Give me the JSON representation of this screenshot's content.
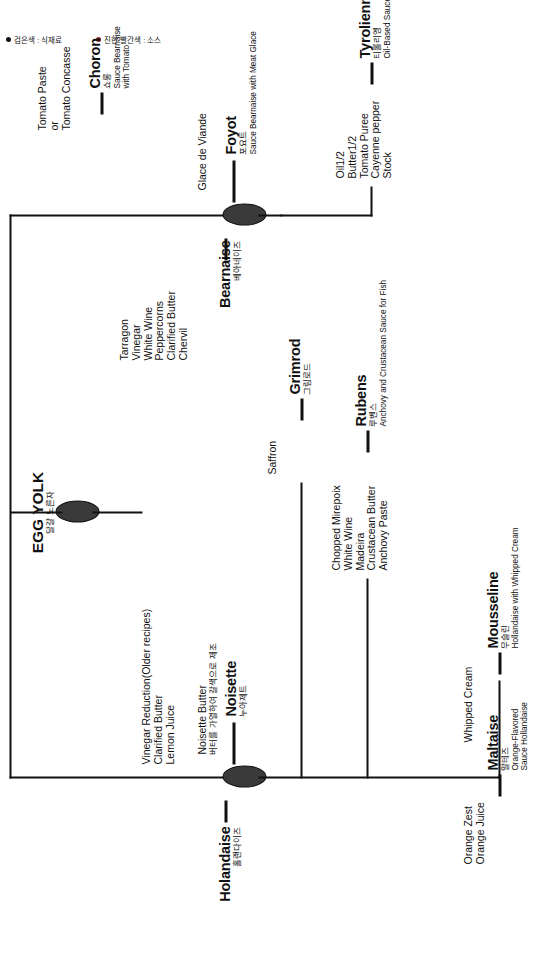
{
  "page": {
    "orientation": "rotated-90",
    "colors": {
      "ingredient": "#111111",
      "sauce": "#8b1a1a",
      "node_fill": "#3a3a3a"
    }
  },
  "legend": {
    "items": [
      {
        "marker": "bullet-black",
        "label": "검은색 : 식재료"
      },
      {
        "marker": "bullet-darkred",
        "label": "진한 빨간색 : 소스"
      }
    ]
  },
  "root": {
    "name": "EGG YOLK",
    "korean": "달걀 노른자"
  },
  "branches": [
    {
      "id": "bearnaise",
      "ingredients": [
        "Tarragon",
        "Vinegar",
        "White Wine",
        "Peppercorns",
        "Clarified Butter",
        "Chervil"
      ],
      "name": "Bearnaise",
      "korean": "베아네이즈",
      "children": [
        {
          "id": "choron",
          "ingredients": [
            "Tomato Paste",
            "or",
            "Tomato Concasse"
          ],
          "name": "Choron",
          "korean": "쇼롱",
          "desc": [
            "Sauce Bearnaise",
            "with Tomato"
          ]
        },
        {
          "id": "foyot",
          "ingredients": [
            "Glace de Viande"
          ],
          "name": "Foyot",
          "korean": "포요트",
          "desc": [
            "Sauce Bearnaise with Meat Glace"
          ]
        },
        {
          "id": "tyrolienne",
          "ingredients": [
            "Oil1/2",
            "Butter1/2",
            "Tomato Puree",
            "Cayenne pepper",
            "Stock"
          ],
          "name": "Tyrolienne",
          "korean": "티롤리엥",
          "desc": [
            "Oil-Based Sauce Bearnaise"
          ]
        }
      ]
    },
    {
      "id": "hollandaise",
      "ingredients": [
        "Vinegar Reduction(Older recipes)",
        "Clarified Butter",
        "Lemon Juice"
      ],
      "name": "Holandaise",
      "korean": "홀랜다이즈",
      "children": [
        {
          "id": "grimrod",
          "ingredients": [
            "Saffron"
          ],
          "name": "Grimrod",
          "korean": "그림로드",
          "desc": []
        },
        {
          "id": "rubens",
          "ingredients": [
            "Chopped Mirepoix",
            "White Wine",
            "Madeira",
            "Crustacean Butter",
            "Anchovy Paste"
          ],
          "name": "Rubens",
          "korean": "루벤스",
          "desc": [
            "Anchovy and Crustacean Sauce for Fish"
          ]
        },
        {
          "id": "noisette",
          "ingredients": [
            "Noisette Butter",
            "버터를 가열하여 갈색으로 제조"
          ],
          "name": "Noisette",
          "korean": "누아제트",
          "desc": []
        },
        {
          "id": "mousseline",
          "ingredients": [
            "Whipped Cream"
          ],
          "name": "Mousseline",
          "korean": "무슬린",
          "desc": [
            "Hollandaise with Whipped Cream"
          ]
        },
        {
          "id": "maltaise",
          "ingredients": [
            "Orange Zest",
            "Orange Juice"
          ],
          "name": "Maltaise",
          "korean": "말테즈",
          "desc": [
            "Orange-Flavored",
            "Sauce Hollandaise"
          ]
        }
      ]
    }
  ]
}
